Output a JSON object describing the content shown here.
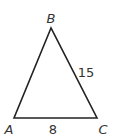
{
  "diagram": {
    "type": "triangle",
    "vertices": [
      {
        "name": "B",
        "x": 51,
        "y": 28,
        "label_x": 51,
        "label_y": 23
      },
      {
        "name": "A",
        "x": 14,
        "y": 118,
        "label_x": 9,
        "label_y": 134
      },
      {
        "name": "C",
        "x": 97,
        "y": 118,
        "label_x": 103,
        "label_y": 134
      }
    ],
    "side_labels": [
      {
        "side": "BC",
        "text": "15",
        "x": 86,
        "y": 76
      },
      {
        "side": "AC",
        "text": "8",
        "x": 53,
        "y": 134
      }
    ],
    "stroke_color": "#222222",
    "label_color": "#333333"
  }
}
